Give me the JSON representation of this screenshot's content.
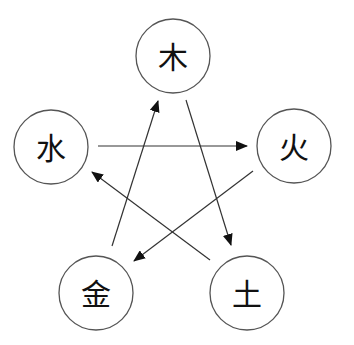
{
  "diagram": {
    "title": "",
    "nodes": [
      {
        "id": "wood",
        "label": "木",
        "cx": 173,
        "cy": 56,
        "r": 37
      },
      {
        "id": "water",
        "label": "水",
        "cx": 51,
        "cy": 147,
        "r": 37
      },
      {
        "id": "fire",
        "label": "火",
        "cx": 294,
        "cy": 146,
        "r": 37
      },
      {
        "id": "metal",
        "label": "金",
        "cx": 96,
        "cy": 293,
        "r": 37
      },
      {
        "id": "earth",
        "label": "土",
        "cx": 247,
        "cy": 293,
        "r": 37
      }
    ],
    "edges": [
      {
        "from": "water",
        "to": "fire",
        "x1": 98,
        "y1": 146,
        "x2": 247,
        "y2": 146
      },
      {
        "from": "fire",
        "to": "metal",
        "x1": 253,
        "y1": 171,
        "x2": 134,
        "y2": 261
      },
      {
        "from": "metal",
        "to": "wood",
        "x1": 112,
        "y1": 246,
        "x2": 158,
        "y2": 101
      },
      {
        "from": "wood",
        "to": "earth",
        "x1": 186,
        "y1": 100,
        "x2": 231,
        "y2": 245
      },
      {
        "from": "earth",
        "to": "water",
        "x1": 210,
        "y1": 260,
        "x2": 92,
        "y2": 172
      }
    ],
    "colors": {
      "stroke": "#555555",
      "text": "#111111",
      "background": "#ffffff"
    }
  }
}
